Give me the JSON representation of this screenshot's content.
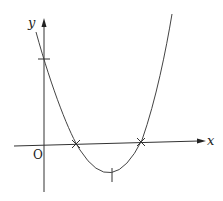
{
  "diagram": {
    "type": "parabola-graph",
    "axes": {
      "x_label": "x",
      "y_label": "y",
      "origin_label": "O"
    },
    "curve": {
      "description": "upward-opening parabola crossing y-axis above origin, two positive x-intercepts, vertex below x-axis",
      "marked_points": [
        {
          "name": "y-intercept",
          "px": [
            44,
            59
          ]
        },
        {
          "name": "x-intercept-1",
          "px": [
            76,
            144
          ]
        },
        {
          "name": "x-intercept-2",
          "px": [
            141,
            142
          ]
        },
        {
          "name": "vertex",
          "px": [
            112,
            174
          ]
        }
      ]
    },
    "colors": {
      "stroke": "#333333",
      "background": "#ffffff"
    }
  }
}
